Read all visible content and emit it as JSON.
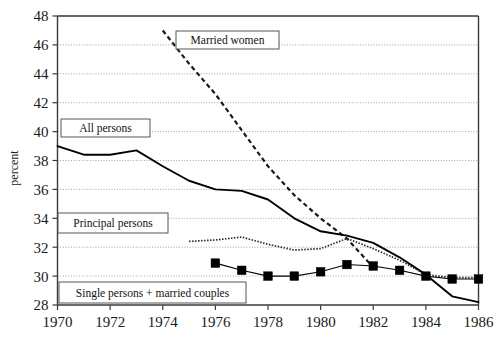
{
  "chart_data": {
    "type": "line",
    "title": "",
    "xlabel": "",
    "ylabel": "percent",
    "xlim": [
      1970,
      1986
    ],
    "ylim": [
      28,
      48
    ],
    "grid": true,
    "legend_position": "inline-callouts",
    "x_ticks": [
      1970,
      1972,
      1974,
      1976,
      1978,
      1980,
      1982,
      1984,
      1986
    ],
    "y_ticks": [
      28,
      30,
      32,
      34,
      36,
      38,
      40,
      42,
      44,
      46,
      48
    ],
    "series": [
      {
        "name": "Married women",
        "style": "dashed",
        "label_text": "Married women",
        "x": [
          1974,
          1975,
          1976,
          1977,
          1978,
          1979,
          1980,
          1981,
          1982
        ],
        "values": [
          47.0,
          44.7,
          42.6,
          40.1,
          37.6,
          35.6,
          34.0,
          32.6,
          30.6
        ]
      },
      {
        "name": "All persons",
        "style": "solid",
        "label_text": "All persons",
        "x": [
          1970,
          1971,
          1972,
          1973,
          1974,
          1975,
          1976,
          1977,
          1978,
          1979,
          1980,
          1981,
          1982,
          1983,
          1984,
          1985,
          1986
        ],
        "values": [
          39.0,
          38.4,
          38.4,
          38.7,
          37.6,
          36.6,
          36.0,
          35.9,
          35.3,
          34.0,
          33.1,
          32.8,
          32.3,
          31.3,
          30.1,
          28.6,
          28.2
        ]
      },
      {
        "name": "Principal persons",
        "style": "dotted",
        "label_text": "Principal persons",
        "x": [
          1975,
          1976,
          1977,
          1978,
          1979,
          1980,
          1981,
          1982,
          1983,
          1984,
          1985,
          1986
        ],
        "values": [
          32.4,
          32.5,
          32.7,
          32.2,
          31.8,
          31.9,
          32.6,
          31.9,
          31.1,
          30.1,
          29.9,
          29.9
        ]
      },
      {
        "name": "Single persons + married couples",
        "style": "marker-square",
        "label_text": "Single persons + married couples",
        "x": [
          1976,
          1977,
          1978,
          1979,
          1980,
          1981,
          1982,
          1983,
          1984,
          1985,
          1986
        ],
        "values": [
          30.9,
          30.4,
          30.0,
          30.0,
          30.3,
          30.8,
          30.7,
          30.4,
          30.0,
          29.8,
          29.8
        ]
      }
    ],
    "callouts": [
      {
        "name": "married-women",
        "text": "Married women",
        "x": 176,
        "y": 31,
        "w": 103,
        "h": 18
      },
      {
        "name": "all-persons",
        "text": "All persons",
        "x": 61,
        "y": 119,
        "w": 89,
        "h": 18
      },
      {
        "name": "principal-persons",
        "text": "Principal persons",
        "x": 58,
        "y": 213,
        "w": 110,
        "h": 20
      },
      {
        "name": "single-persons-married-couples",
        "text": "Single persons + married couples",
        "x": 59,
        "y": 282,
        "w": 187,
        "h": 21
      }
    ]
  },
  "axes": {
    "y_label": "percent",
    "y_tick_labels": [
      "48",
      "46",
      "44",
      "42",
      "40",
      "38",
      "36",
      "34",
      "32",
      "30",
      "28"
    ],
    "x_tick_labels": [
      "1970",
      "1972",
      "1974",
      "1976",
      "1978",
      "1980",
      "1982",
      "1984",
      "1986"
    ]
  }
}
